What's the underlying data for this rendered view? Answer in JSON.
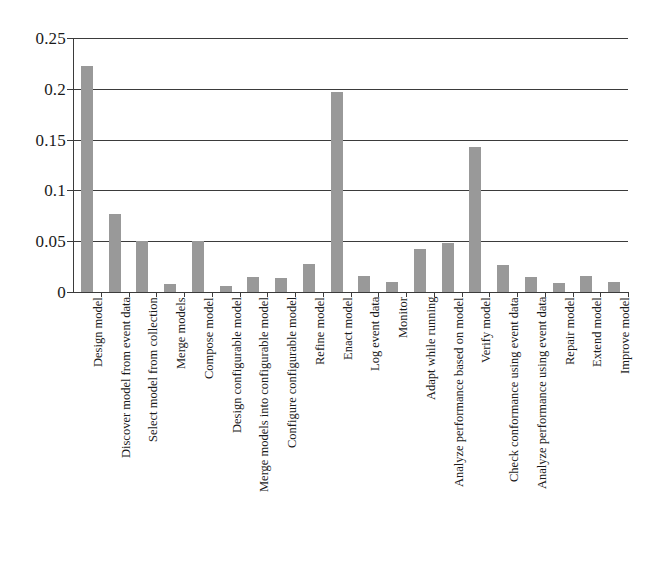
{
  "chart_data": {
    "type": "bar",
    "title": "",
    "subtitle": "",
    "xlabel": "",
    "ylabel": "",
    "ylim": [
      0,
      0.25
    ],
    "xlim_note": "categorical",
    "grid": true,
    "grid_axis": "y",
    "legend": false,
    "legend_position": "none",
    "bar_color": "#999999",
    "axis_color": "#3b3b3b",
    "background_color": "#ffffff",
    "y_ticks": [
      "0",
      "0.05",
      "0.1",
      "0.15",
      "0.2",
      "0.25"
    ],
    "y_tick_values": [
      0,
      0.05,
      0.1,
      0.15,
      0.2,
      0.25
    ],
    "categories": [
      "Design model",
      "Discover model from event data",
      "Select model from collection",
      "Merge models",
      "Compose model",
      "Design configurable model",
      "Merge models into configurable model",
      "Configure configurable model",
      "Refine model",
      "Enact model",
      "Log event data",
      "Monitor",
      "Adapt while running",
      "Analyze performance based on model",
      "Verify model",
      "Check conformance using event data",
      "Analyze performance using event data",
      "Repair model",
      "Extend model",
      "Improve model"
    ],
    "values": [
      0.222,
      0.077,
      0.05,
      0.008,
      0.05,
      0.006,
      0.015,
      0.014,
      0.028,
      0.197,
      0.016,
      0.01,
      0.042,
      0.048,
      0.143,
      0.027,
      0.015,
      0.009,
      0.016,
      0.01
    ]
  }
}
